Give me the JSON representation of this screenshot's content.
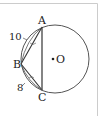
{
  "diagram": {
    "points": {
      "A": "A",
      "B": "B",
      "C": "C",
      "O": "O"
    },
    "lengths": {
      "AB": "10",
      "BC": "8"
    },
    "colors": {
      "stroke": "#444444",
      "border": "#cccccc"
    }
  }
}
